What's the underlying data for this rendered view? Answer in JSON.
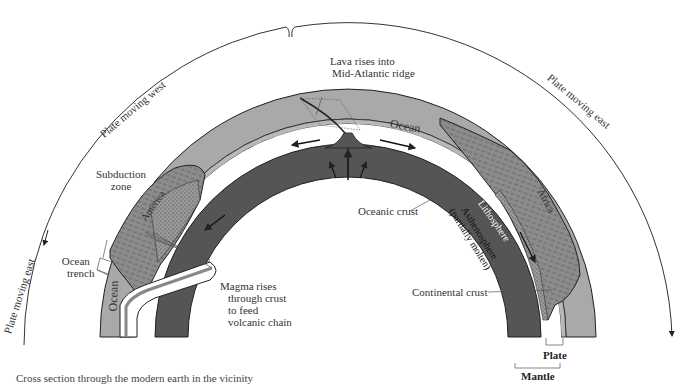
{
  "diagram": {
    "type": "cross-section",
    "arc_labels": {
      "left_top": "Plate moving west",
      "right_top": "Plate moving east",
      "left_side": "Plate moving east"
    },
    "labels": {
      "lava": "Lava rises into",
      "lava_line2": "Mid-Atlantic ridge",
      "ocean_top": "Ocean",
      "ocean_left": "Ocean",
      "subduction": "Subduction",
      "subduction_line2": "zone",
      "ocean_trench": "Ocean",
      "ocean_trench_line2": "trench",
      "america": "America",
      "africa": "Africa",
      "magma_1": "Magma rises",
      "magma_2": "through crust",
      "magma_3": "to feed",
      "magma_4": "volcanic chain",
      "oceanic_crust": "Oceanic crust",
      "lithosphere": "Lithosphere",
      "asthenosphere": "Asthenosphere",
      "asthenosphere_line2": "(partially molten)",
      "continental_crust": "Continental crust",
      "plate": "Plate",
      "mantle": "Mantle"
    },
    "caption": "Cross section through the modern earth in the vicinity",
    "colors": {
      "ocean": "#a9a9a9",
      "continent": "#8e8e8e",
      "asthenosphere": "#555555",
      "lithosphere_gap": "#ffffff",
      "outline": "#222222"
    }
  }
}
